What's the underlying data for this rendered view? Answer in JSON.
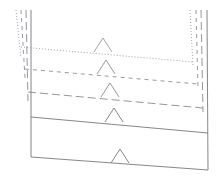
{
  "diagram": {
    "width": 223,
    "height": 186,
    "background_color": "#ffffff",
    "stroke_color": "#8a8a92",
    "stroke_color_solid": "#6f6f78",
    "stroke_width": 0.9,
    "vessels": [
      {
        "name": "vessel-outer-dotted",
        "line_style": "dotted",
        "dash_array": "1,2",
        "stroke_color": "#9a9aa2",
        "left_top_x": 16,
        "left_top_y": 10,
        "left_bottom_x": 21,
        "left_bottom_y": 58,
        "right_top_x": 190,
        "right_top_y": 10,
        "right_bottom_x": 193,
        "right_bottom_y": 66,
        "level_y_left": 47,
        "level_y_right": 62,
        "marker_x": 103,
        "marker_y": 52,
        "marker_height": 14,
        "marker_half_width": 9
      },
      {
        "name": "vessel-second-dashed-short",
        "line_style": "dashed",
        "dash_array": "4,4",
        "stroke_color": "#8f8f97",
        "left_top_x": 21,
        "left_top_y": 10,
        "left_bottom_x": 25,
        "left_bottom_y": 78,
        "right_top_x": 196,
        "right_top_y": 10,
        "right_bottom_x": 198,
        "right_bottom_y": 88,
        "level_y_left": 69,
        "level_y_right": 84,
        "marker_x": 106,
        "marker_y": 74,
        "marker_height": 14,
        "marker_half_width": 9
      },
      {
        "name": "vessel-third-dashdot",
        "line_style": "dash-dot",
        "dash_array": "8,4",
        "stroke_color": "#8a8a92",
        "left_top_x": 26,
        "left_top_y": 10,
        "left_bottom_x": 28,
        "left_bottom_y": 101,
        "right_top_x": 201,
        "right_top_y": 10,
        "right_bottom_x": 203,
        "right_bottom_y": 112,
        "level_y_left": 92,
        "level_y_right": 108,
        "marker_x": 110,
        "marker_y": 97,
        "marker_height": 14,
        "marker_half_width": 9
      },
      {
        "name": "vessel-inner-solid",
        "line_style": "solid",
        "dash_array": "none",
        "stroke_color": "#77777f",
        "left_top_x": 31,
        "left_top_y": 10,
        "left_bottom_x": 31,
        "left_bottom_y": 157,
        "right_top_x": 207,
        "right_top_y": 10,
        "right_bottom_x": 208,
        "right_bottom_y": 170,
        "level_y_left": 117,
        "level_y_right": 133,
        "marker_x": 114,
        "marker_y": 122,
        "marker_height": 14,
        "marker_half_width": 9
      }
    ],
    "base_line": {
      "name": "vessel-base-solid",
      "line_style": "solid",
      "stroke_color": "#77777f",
      "left_x": 31,
      "left_y": 157,
      "right_x": 208,
      "right_y": 170,
      "marker_x": 120,
      "marker_y": 163,
      "marker_height": 14,
      "marker_half_width": 9
    },
    "level_markers": [
      {
        "name": "level-marker-1",
        "index": 1
      },
      {
        "name": "level-marker-2",
        "index": 2
      },
      {
        "name": "level-marker-3",
        "index": 3
      },
      {
        "name": "level-marker-4",
        "index": 4
      },
      {
        "name": "level-marker-5",
        "index": 5
      }
    ]
  }
}
